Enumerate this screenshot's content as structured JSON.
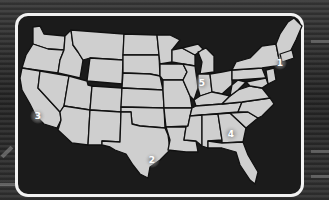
{
  "map": {
    "type": "us-states-outline",
    "colors": {
      "land": "#cfcfcf",
      "borders": "#111111",
      "water": "#1b1b1b",
      "frame": "#f2f2f2",
      "marker_label": "#ffffff",
      "marker_glow": "#7a7a7a"
    },
    "markers": [
      {
        "id": 1,
        "label": "1",
        "region": "Northeast (New York area)",
        "x": 280,
        "y": 63
      },
      {
        "id": 2,
        "label": "2",
        "region": "Texas (Houston area)",
        "x": 152,
        "y": 160
      },
      {
        "id": 3,
        "label": "3",
        "region": "Southern California (Los Angeles area)",
        "x": 38,
        "y": 116
      },
      {
        "id": 4,
        "label": "4",
        "region": "Georgia (Atlanta area)",
        "x": 231,
        "y": 134
      },
      {
        "id": 5,
        "label": "5",
        "region": "Illinois (Chicago area)",
        "x": 202,
        "y": 83
      }
    ]
  }
}
